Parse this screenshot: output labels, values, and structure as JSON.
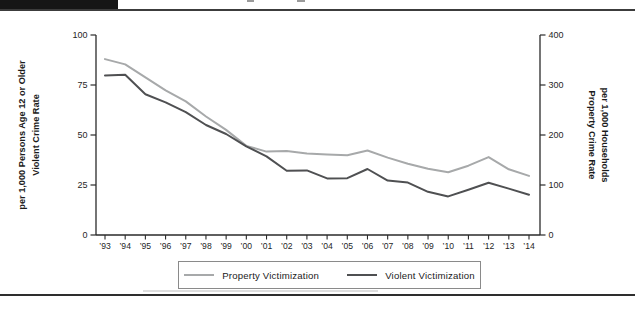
{
  "page": {
    "top_bar_color": "#161616",
    "rule_color": "#3c3c3c",
    "background": "#ffffff",
    "text_color": "#1f1f1f"
  },
  "chart_data": {
    "type": "line",
    "title": "",
    "x_labels": [
      "’93",
      "’94",
      "’95",
      "’96",
      "’97",
      "’98",
      "’99",
      "’00",
      "’01",
      "’02",
      "’03",
      "’04",
      "’05",
      "’06",
      "’07",
      "’08",
      "’09",
      "’10",
      "’11",
      "’12",
      "’13",
      "’14"
    ],
    "years": [
      1993,
      1994,
      1995,
      1996,
      1997,
      1998,
      1999,
      2000,
      2001,
      2002,
      2003,
      2004,
      2005,
      2006,
      2007,
      2008,
      2009,
      2010,
      2011,
      2012,
      2013,
      2014
    ],
    "series": [
      {
        "name": "Property Victimization",
        "axis": "right",
        "color": "#a7a9aa",
        "values": [
          351.8,
          341.2,
          315.5,
          289.3,
          267.1,
          237.0,
          210.1,
          178.1,
          166.9,
          168.2,
          163.2,
          161.1,
          159.5,
          169.0,
          154.9,
          142.7,
          132.6,
          125.4,
          138.7,
          155.8,
          131.4,
          118.1
        ]
      },
      {
        "name": "Violent Victimization",
        "axis": "left",
        "color": "#4f5052",
        "values": [
          79.8,
          80.1,
          70.4,
          66.3,
          61.4,
          55.0,
          50.5,
          44.3,
          39.3,
          32.1,
          32.3,
          28.3,
          28.4,
          33.0,
          27.2,
          26.2,
          21.6,
          19.3,
          22.6,
          26.1,
          23.2,
          20.1
        ]
      }
    ],
    "left_axis": {
      "title_line1": "Violent Crime Rate",
      "title_line2": "per 1,000 Persons Age 12 or Older",
      "ticks": [
        0,
        25,
        50,
        75,
        100
      ],
      "range": [
        0,
        100
      ]
    },
    "right_axis": {
      "title_line1": "Property Crime Rate",
      "title_line2": "per 1,000 Households",
      "ticks": [
        0,
        100,
        200,
        300,
        400
      ],
      "range": [
        0,
        400
      ]
    },
    "grid": false,
    "legend_position": "bottom"
  }
}
